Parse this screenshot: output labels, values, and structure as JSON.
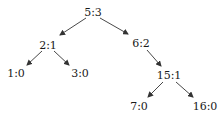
{
  "diagram": {
    "type": "binary-tree",
    "nodes": [
      {
        "id": "n5",
        "label": "5:3",
        "x": 93,
        "y": 12
      },
      {
        "id": "n2",
        "label": "2:1",
        "x": 48,
        "y": 45
      },
      {
        "id": "n6",
        "label": "6:2",
        "x": 141,
        "y": 43
      },
      {
        "id": "n1",
        "label": "1:0",
        "x": 16,
        "y": 73
      },
      {
        "id": "n3",
        "label": "3:0",
        "x": 80,
        "y": 73
      },
      {
        "id": "n15",
        "label": "15:1",
        "x": 169,
        "y": 75
      },
      {
        "id": "n7",
        "label": "7:0",
        "x": 139,
        "y": 106
      },
      {
        "id": "n16",
        "label": "16:0",
        "x": 205,
        "y": 106
      }
    ],
    "edges": [
      {
        "from": "n5",
        "to": "n2",
        "x1": 86,
        "y1": 18,
        "x2": 60,
        "y2": 35
      },
      {
        "from": "n5",
        "to": "n6",
        "x1": 100,
        "y1": 18,
        "x2": 128,
        "y2": 34
      },
      {
        "from": "n2",
        "to": "n1",
        "x1": 42,
        "y1": 51,
        "x2": 27,
        "y2": 65
      },
      {
        "from": "n2",
        "to": "n3",
        "x1": 54,
        "y1": 51,
        "x2": 69,
        "y2": 65
      },
      {
        "from": "n6",
        "to": "n15",
        "x1": 147,
        "y1": 50,
        "x2": 161,
        "y2": 66
      },
      {
        "from": "n15",
        "to": "n7",
        "x1": 163,
        "y1": 82,
        "x2": 148,
        "y2": 97
      },
      {
        "from": "n15",
        "to": "n16",
        "x1": 176,
        "y1": 82,
        "x2": 193,
        "y2": 97
      }
    ],
    "colors": {
      "edge": "#333333",
      "text": "#1a1a1a",
      "background": "#ffffff"
    }
  }
}
